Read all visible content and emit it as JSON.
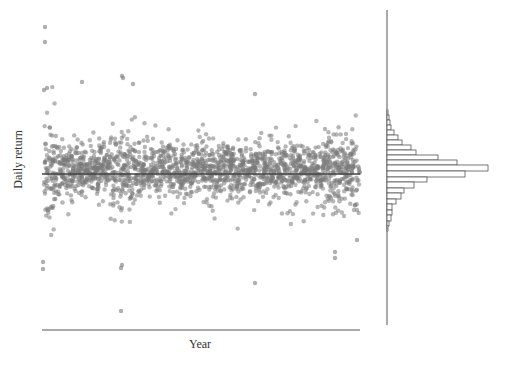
{
  "chart_data": {
    "type": "scatter",
    "title": "",
    "xlabel": "Year",
    "ylabel": "Daily return",
    "grid": false,
    "legend": null,
    "colors": {
      "points": "#7a7a7a",
      "mean_line": "#444444",
      "axis": "#555555",
      "hist_edge": "#555555"
    },
    "scatter": {
      "description": "Dense cloud of daily returns over time (~2000 points), roughly stationary, clustered tightly around the mean with volatility spikes",
      "approx_point_count": 2000,
      "mean_line_pixel_y": 174,
      "x_pixel_range": [
        42,
        360
      ],
      "outliers_high_pixel": [
        [
          45,
          27
        ],
        [
          45,
          42
        ],
        [
          82,
          82
        ],
        [
          122,
          76
        ],
        [
          123,
          78
        ],
        [
          133,
          84
        ],
        [
          255,
          94
        ],
        [
          44,
          90
        ],
        [
          47,
          88
        ]
      ],
      "outliers_low_pixel": [
        [
          121,
          311
        ],
        [
          122,
          265
        ],
        [
          121,
          268
        ],
        [
          43,
          262
        ],
        [
          43,
          269
        ],
        [
          255,
          283
        ],
        [
          335,
          252
        ],
        [
          335,
          258
        ],
        [
          357,
          240
        ]
      ]
    },
    "marginal_histogram": {
      "orientation": "horizontal",
      "baseline_pixel_x": 387,
      "axis_pixel_y_range": [
        10,
        325
      ],
      "bins_pixel_y_top": [
        110,
        115,
        120,
        125,
        130,
        135,
        140,
        145,
        150,
        155,
        160,
        165,
        171,
        177,
        182,
        188,
        193,
        199,
        204,
        210,
        215,
        221,
        226
      ],
      "bar_lengths_px": [
        1,
        2,
        3,
        4,
        7,
        11,
        15,
        24,
        29,
        51,
        70,
        101,
        78,
        40,
        27,
        17,
        14,
        9,
        5,
        5,
        4,
        2,
        1
      ]
    }
  }
}
